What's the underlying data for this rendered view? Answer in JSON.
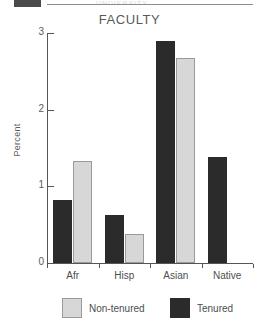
{
  "page_header": {
    "box_icon": "filled-block-icon",
    "faint_text": "UNIVERSITY"
  },
  "chart_data": {
    "type": "bar",
    "title": "FACULTY",
    "xlabel": "",
    "ylabel": "Percent",
    "categories": [
      "Afr",
      "Hisp",
      "Asian",
      "Native"
    ],
    "series": [
      {
        "name": "Tenured",
        "color": "#2b2b2b",
        "values": [
          0.82,
          0.63,
          2.9,
          1.38
        ]
      },
      {
        "name": "Non-tenured",
        "color": "#d7d7d7",
        "values": [
          1.33,
          0.38,
          2.67,
          0
        ]
      }
    ],
    "ylim": [
      0,
      3
    ],
    "yticks": [
      0,
      1,
      2,
      3
    ],
    "ytick_labels": [
      "0",
      "1",
      "2",
      "3"
    ],
    "grid": false,
    "legend_position": "bottom",
    "series_draw_order": [
      "Tenured",
      "Non-tenured"
    ]
  },
  "legend": {
    "items": [
      {
        "label": "Non-tenured",
        "swatch": "nontenured"
      },
      {
        "label": "Tenured",
        "swatch": "tenured"
      }
    ]
  }
}
